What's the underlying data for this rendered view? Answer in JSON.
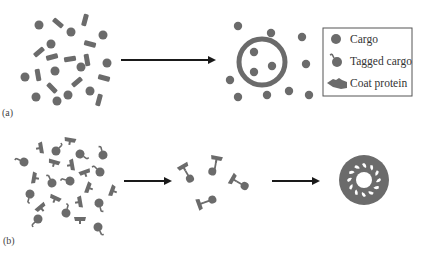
{
  "figure": {
    "panels": [
      {
        "label": "(a)",
        "stages": [
          "scattered cargo and coat proteins",
          "vesicle with enclosed cargo"
        ]
      },
      {
        "label": "(b)",
        "stages": [
          "scattered tagged cargo and coat proteins",
          "coat proteins bound to tagged cargo",
          "assembled coated vesicle"
        ]
      }
    ],
    "legend": {
      "items": [
        {
          "icon": "cargo-icon",
          "label": "Cargo"
        },
        {
          "icon": "tagged-cargo-icon",
          "label": "Tagged cargo"
        },
        {
          "icon": "coat-protein-icon",
          "label": "Coat protein"
        }
      ]
    },
    "colors": {
      "shape_fill": "#6b6b6b",
      "arrow": "#1a1a1a",
      "legend_border": "#555555",
      "text": "#333333"
    }
  }
}
